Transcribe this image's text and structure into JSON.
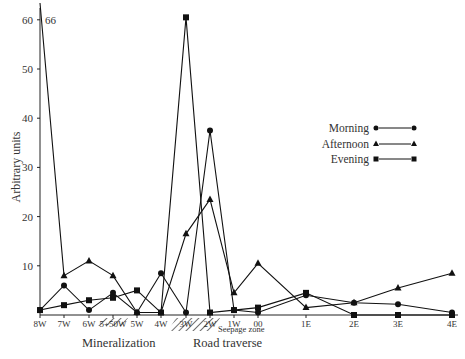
{
  "chart_data": {
    "type": "line",
    "title": "",
    "xlabel": "",
    "ylabel": "Arbitrary units",
    "ylim": [
      0,
      62
    ],
    "yticks": [
      10,
      20,
      30,
      40,
      50,
      60
    ],
    "categories": [
      "8W",
      "7W",
      "6W",
      "5+50W",
      "5W",
      "4W",
      "3W",
      "2W",
      "1W",
      "00",
      "1E",
      "2E",
      "3E",
      "4E"
    ],
    "series": [
      {
        "name": "Morning",
        "marker": "circle",
        "values": [
          1,
          6,
          1,
          4.5,
          0.5,
          8.5,
          0.5,
          37.5,
          1,
          0.5,
          4,
          2.5,
          2.2,
          0.5
        ]
      },
      {
        "name": "Afternoon",
        "marker": "triangle",
        "values": [
          66,
          8,
          11,
          8,
          0.5,
          0.5,
          16.5,
          23.5,
          4.5,
          10.5,
          1.5,
          2.5,
          5.5,
          8.5
        ]
      },
      {
        "name": "Evening",
        "marker": "square",
        "values": [
          1,
          2,
          3,
          3.5,
          5,
          0.5,
          60.5,
          0.5,
          1,
          1.5,
          4.5,
          0,
          0,
          0
        ]
      }
    ],
    "annotations": [
      {
        "text": "66",
        "attached_to": "Afternoon at 8W (off-scale value)"
      },
      {
        "text": "Seepage zone",
        "region": [
          "4W",
          "2W"
        ]
      }
    ],
    "region_labels": [
      "Mineralization",
      "Road traverse"
    ],
    "legend": {
      "placement": "right",
      "entries": [
        "Morning",
        "Afternoon",
        "Evening"
      ]
    },
    "grid": false
  }
}
